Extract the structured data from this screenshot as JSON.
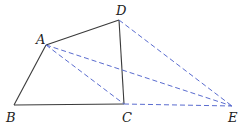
{
  "diagram": {
    "points": {
      "A": {
        "label": "A",
        "x": 46,
        "y": 45,
        "lx": 36,
        "ly": 44
      },
      "B": {
        "label": "B",
        "x": 14,
        "y": 105,
        "lx": 6,
        "ly": 122
      },
      "C": {
        "label": "C",
        "x": 124,
        "y": 104,
        "lx": 122,
        "ly": 122
      },
      "D": {
        "label": "D",
        "x": 119,
        "y": 20,
        "lx": 116,
        "ly": 15
      },
      "E": {
        "label": "E",
        "x": 232,
        "y": 106,
        "lx": 228,
        "ly": 122
      }
    },
    "solid_segments": [
      [
        "A",
        "B"
      ],
      [
        "B",
        "C"
      ],
      [
        "C",
        "D"
      ],
      [
        "D",
        "A"
      ]
    ],
    "dashed_segments": [
      [
        "A",
        "C"
      ],
      [
        "A",
        "E"
      ],
      [
        "D",
        "E"
      ],
      [
        "C",
        "E"
      ]
    ],
    "colors": {
      "solid": "#3a3a3a",
      "dashed": "#5a6ccf"
    }
  }
}
